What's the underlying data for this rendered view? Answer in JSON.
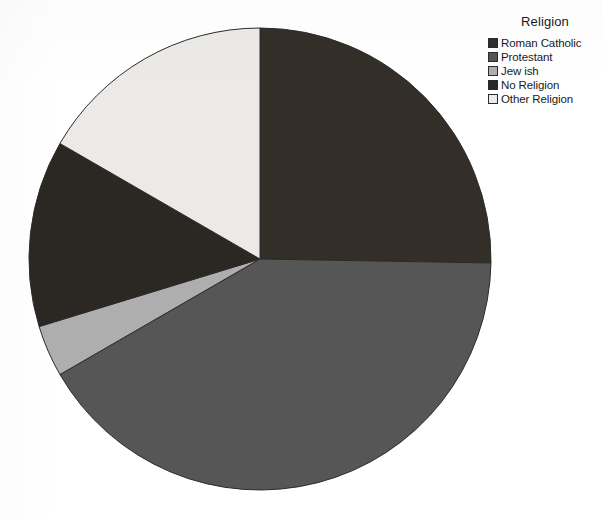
{
  "legend": {
    "title": "Religion",
    "items": [
      {
        "label": "Roman Catholic",
        "color": "#332e28"
      },
      {
        "label": "Protestant",
        "color": "#565656"
      },
      {
        "label": "Jew ish",
        "color": "#aeaeae"
      },
      {
        "label": "No Religion",
        "color": "#2b2722"
      },
      {
        "label": "Other Religion",
        "color": "#eceae7"
      }
    ]
  },
  "chart_data": {
    "type": "pie",
    "title": "",
    "legend_title": "Religion",
    "legend_position": "right-top",
    "start_angle_deg": 0,
    "direction": "clockwise",
    "categories": [
      "Roman Catholic",
      "Protestant",
      "Jew ish",
      "No Religion",
      "Other Religion"
    ],
    "values": [
      25.3,
      41.4,
      3.6,
      13.1,
      16.6
    ],
    "unit": "percent",
    "colors": [
      "#332e28",
      "#565656",
      "#aeaeae",
      "#2b2722",
      "#eceae7"
    ],
    "slices": [
      {
        "label": "Roman Catholic",
        "value": 25.3,
        "start_deg": 0.0,
        "end_deg": 91.0,
        "color": "#332e28"
      },
      {
        "label": "Protestant",
        "value": 41.4,
        "start_deg": 91.0,
        "end_deg": 240.0,
        "color": "#565656"
      },
      {
        "label": "Jew ish",
        "value": 3.6,
        "start_deg": 240.0,
        "end_deg": 253.0,
        "color": "#aeaeae"
      },
      {
        "label": "No Religion",
        "value": 13.1,
        "start_deg": 253.0,
        "end_deg": 300.0,
        "color": "#2b2722"
      },
      {
        "label": "Other Religion",
        "value": 16.6,
        "start_deg": 300.0,
        "end_deg": 360.0,
        "color": "#eceae7"
      }
    ],
    "geometry": {
      "cx": 260,
      "cy": 259,
      "r": 231
    },
    "grid": false,
    "xlabel": "",
    "ylabel": ""
  }
}
